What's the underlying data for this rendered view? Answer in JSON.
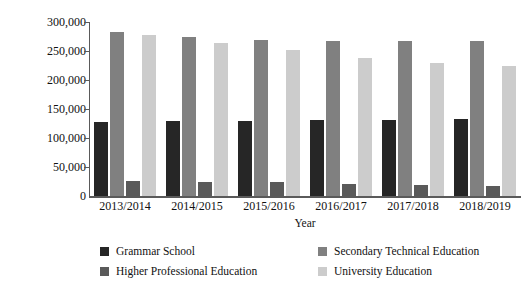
{
  "chart_data": {
    "type": "bar",
    "title": "",
    "xlabel": "Year",
    "ylabel": "People educated",
    "categories": [
      "2013/2014",
      "2014/2015",
      "2015/2016",
      "2016/2017",
      "2017/2018",
      "2018/2019"
    ],
    "ylim": [
      0,
      300000
    ],
    "ytick_values": [
      0,
      50000,
      100000,
      150000,
      200000,
      250000,
      300000
    ],
    "ytick_labels": [
      "0",
      "50,000",
      "100,000",
      "150,000",
      "200,000",
      "250,000",
      "300,000"
    ],
    "grid": false,
    "legend_position": "bottom",
    "series": [
      {
        "name": "Grammar School",
        "color": "#262626",
        "values": [
          128000,
          128500,
          129000,
          131500,
          131000,
          133000
        ]
      },
      {
        "name": "Secondary Technical Education",
        "color": "#808080",
        "values": [
          283000,
          274000,
          269000,
          267000,
          268000,
          268000
        ]
      },
      {
        "name": "Higher Professional Education",
        "color": "#5a5a5a",
        "values": [
          25500,
          24500,
          23500,
          21500,
          19000,
          18000
        ]
      },
      {
        "name": "University Education",
        "color": "#cccccc",
        "values": [
          277000,
          263000,
          251000,
          238000,
          230000,
          225000
        ]
      }
    ]
  },
  "axis": {
    "y_title": "People educated",
    "x_title": "Year"
  },
  "legend": {
    "items": [
      {
        "label": "Grammar School",
        "color": "#262626"
      },
      {
        "label": "Secondary Technical Education",
        "color": "#808080"
      },
      {
        "label": "Higher Professional Education",
        "color": "#5a5a5a"
      },
      {
        "label": "University Education",
        "color": "#cccccc"
      }
    ]
  }
}
